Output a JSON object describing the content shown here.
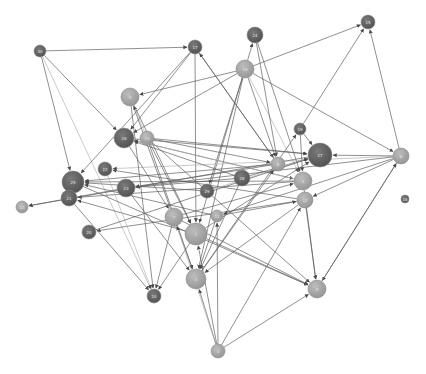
{
  "graph": {
    "type": "directed-network",
    "colors": {
      "dark_node": "#5e5e5e",
      "light_node": "#a3a3a3",
      "edge": "#5a5a5a",
      "background": "#ffffff"
    },
    "nodes": [
      {
        "id": "30",
        "x": 40,
        "y": 51,
        "r": 6,
        "shade": "dark"
      },
      {
        "id": "17",
        "x": 195,
        "y": 47,
        "r": 7,
        "shade": "dark"
      },
      {
        "id": "24",
        "x": 255,
        "y": 35,
        "r": 8,
        "shade": "dark"
      },
      {
        "id": "15",
        "x": 368,
        "y": 22,
        "r": 7,
        "shade": "dark"
      },
      {
        "id": "18",
        "x": 245,
        "y": 69,
        "r": 9,
        "shade": "light"
      },
      {
        "id": "9",
        "x": 130,
        "y": 97,
        "r": 9,
        "shade": "light"
      },
      {
        "id": "26",
        "x": 124,
        "y": 138,
        "r": 10,
        "shade": "dark"
      },
      {
        "id": "14",
        "x": 147,
        "y": 138,
        "r": 7,
        "shade": "light"
      },
      {
        "id": "19",
        "x": 300,
        "y": 129,
        "r": 6,
        "shade": "dark"
      },
      {
        "id": "27",
        "x": 320,
        "y": 155,
        "r": 12,
        "shade": "dark"
      },
      {
        "id": "8",
        "x": 278,
        "y": 164,
        "r": 7,
        "shade": "light"
      },
      {
        "id": "6",
        "x": 401,
        "y": 156,
        "r": 8,
        "shade": "light"
      },
      {
        "id": "22",
        "x": 105,
        "y": 169,
        "r": 7,
        "shade": "dark"
      },
      {
        "id": "25",
        "x": 73,
        "y": 182,
        "r": 11,
        "shade": "dark"
      },
      {
        "id": "21",
        "x": 69,
        "y": 198,
        "r": 8,
        "shade": "dark"
      },
      {
        "id": "23",
        "x": 126,
        "y": 188,
        "r": 9,
        "shade": "dark"
      },
      {
        "id": "29",
        "x": 207,
        "y": 191,
        "r": 7,
        "shade": "dark"
      },
      {
        "id": "28",
        "x": 242,
        "y": 178,
        "r": 8,
        "shade": "dark"
      },
      {
        "id": "4",
        "x": 303,
        "y": 181,
        "r": 9,
        "shade": "light"
      },
      {
        "id": "12",
        "x": 305,
        "y": 200,
        "r": 8,
        "shade": "light"
      },
      {
        "id": "16",
        "x": 405,
        "y": 199,
        "r": 4,
        "shade": "dark"
      },
      {
        "id": "13",
        "x": 22,
        "y": 207,
        "r": 6,
        "shade": "light"
      },
      {
        "id": "7",
        "x": 174,
        "y": 217,
        "r": 9,
        "shade": "light"
      },
      {
        "id": "11",
        "x": 217,
        "y": 216,
        "r": 6,
        "shade": "light"
      },
      {
        "id": "20",
        "x": 89,
        "y": 232,
        "r": 7,
        "shade": "dark"
      },
      {
        "id": "1",
        "x": 196,
        "y": 234,
        "r": 11,
        "shade": "light"
      },
      {
        "id": "10",
        "x": 154,
        "y": 296,
        "r": 7,
        "shade": "dark"
      },
      {
        "id": "3",
        "x": 196,
        "y": 279,
        "r": 10,
        "shade": "light"
      },
      {
        "id": "5",
        "x": 317,
        "y": 289,
        "r": 9,
        "shade": "light"
      },
      {
        "id": "2",
        "x": 218,
        "y": 351,
        "r": 7,
        "shade": "light"
      }
    ],
    "edges": [
      [
        "30",
        "17"
      ],
      [
        "30",
        "26"
      ],
      [
        "30",
        "25"
      ],
      [
        "30",
        "10"
      ],
      [
        "17",
        "26"
      ],
      [
        "17",
        "25"
      ],
      [
        "17",
        "1"
      ],
      [
        "17",
        "8"
      ],
      [
        "18",
        "24"
      ],
      [
        "18",
        "15"
      ],
      [
        "18",
        "9"
      ],
      [
        "18",
        "26"
      ],
      [
        "18",
        "6"
      ],
      [
        "18",
        "8"
      ],
      [
        "18",
        "4"
      ],
      [
        "18",
        "1"
      ],
      [
        "18",
        "3"
      ],
      [
        "18",
        "29"
      ],
      [
        "24",
        "4"
      ],
      [
        "24",
        "8"
      ],
      [
        "19",
        "15"
      ],
      [
        "19",
        "27"
      ],
      [
        "19",
        "4"
      ],
      [
        "6",
        "15"
      ],
      [
        "6",
        "27"
      ],
      [
        "6",
        "22"
      ],
      [
        "6",
        "23"
      ],
      [
        "6",
        "12"
      ],
      [
        "6",
        "5"
      ],
      [
        "6",
        "11"
      ],
      [
        "9",
        "3"
      ],
      [
        "9",
        "10"
      ],
      [
        "9",
        "1"
      ],
      [
        "26",
        "7"
      ],
      [
        "26",
        "4"
      ],
      [
        "26",
        "27"
      ],
      [
        "14",
        "9"
      ],
      [
        "14",
        "27"
      ],
      [
        "14",
        "8"
      ],
      [
        "14",
        "5"
      ],
      [
        "14",
        "3"
      ],
      [
        "14",
        "1"
      ],
      [
        "8",
        "25"
      ],
      [
        "8",
        "23"
      ],
      [
        "8",
        "17"
      ],
      [
        "4",
        "25"
      ],
      [
        "4",
        "21"
      ],
      [
        "4",
        "26"
      ],
      [
        "4",
        "5"
      ],
      [
        "12",
        "20"
      ],
      [
        "12",
        "22"
      ],
      [
        "12",
        "5"
      ],
      [
        "12",
        "3"
      ],
      [
        "28",
        "23"
      ],
      [
        "28",
        "26"
      ],
      [
        "28",
        "27"
      ],
      [
        "28",
        "3"
      ],
      [
        "29",
        "25"
      ],
      [
        "29",
        "27"
      ],
      [
        "7",
        "10"
      ],
      [
        "7",
        "4"
      ],
      [
        "7",
        "5"
      ],
      [
        "11",
        "25"
      ],
      [
        "11",
        "12"
      ],
      [
        "11",
        "3"
      ],
      [
        "1",
        "21"
      ],
      [
        "1",
        "10"
      ],
      [
        "1",
        "5"
      ],
      [
        "1",
        "27"
      ],
      [
        "22",
        "10"
      ],
      [
        "25",
        "5"
      ],
      [
        "21",
        "10"
      ],
      [
        "20",
        "27"
      ],
      [
        "23",
        "3"
      ],
      [
        "23",
        "13"
      ],
      [
        "27",
        "13"
      ],
      [
        "2",
        "3"
      ],
      [
        "2",
        "5"
      ],
      [
        "2",
        "1"
      ],
      [
        "2",
        "11"
      ],
      [
        "2",
        "7"
      ],
      [
        "2",
        "12"
      ],
      [
        "3",
        "8"
      ],
      [
        "3",
        "19"
      ],
      [
        "5",
        "6"
      ]
    ]
  }
}
